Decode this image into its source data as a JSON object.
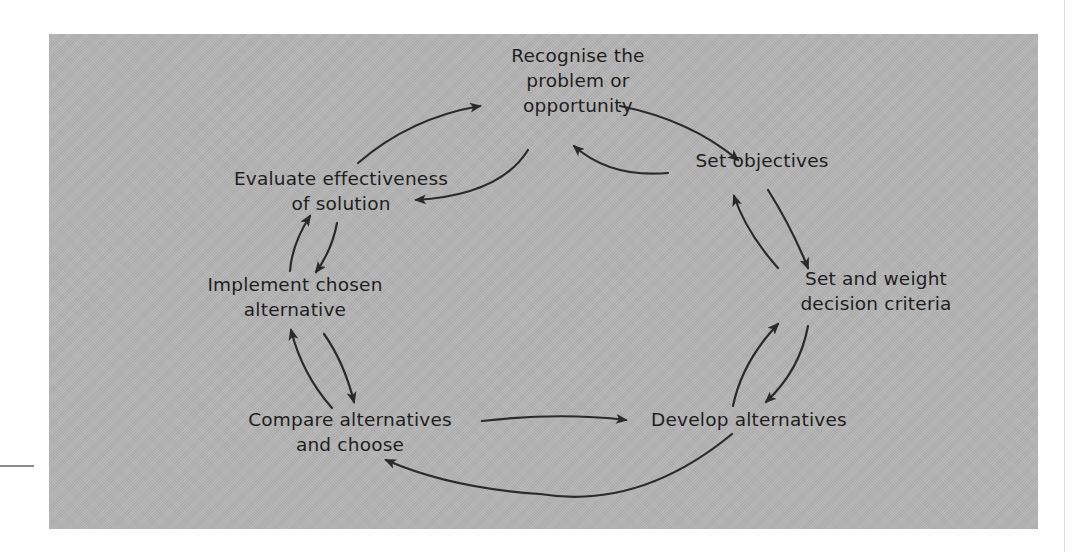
{
  "diagram": {
    "colors": {
      "panel_background": "#b4b4b4",
      "text": "#1e1e1e",
      "arrow": "#2a2a2a",
      "page_background": "#ffffff"
    },
    "nodes": [
      {
        "id": "recognise",
        "lines": [
          "Recognise the",
          "problem or",
          "opportunity"
        ]
      },
      {
        "id": "objectives",
        "lines": [
          "Set objectives"
        ]
      },
      {
        "id": "criteria",
        "lines": [
          "Set and weight",
          "decision criteria"
        ]
      },
      {
        "id": "develop",
        "lines": [
          "Develop alternatives"
        ]
      },
      {
        "id": "compare",
        "lines": [
          "Compare alternatives",
          "and choose"
        ]
      },
      {
        "id": "implement",
        "lines": [
          "Implement chosen",
          "alternative"
        ]
      },
      {
        "id": "evaluate",
        "lines": [
          "Evaluate effectiveness",
          "of solution"
        ]
      }
    ],
    "edges": [
      {
        "from": "recognise",
        "to": "objectives"
      },
      {
        "from": "objectives",
        "to": "recognise"
      },
      {
        "from": "objectives",
        "to": "criteria"
      },
      {
        "from": "criteria",
        "to": "objectives"
      },
      {
        "from": "criteria",
        "to": "develop"
      },
      {
        "from": "develop",
        "to": "criteria"
      },
      {
        "from": "compare",
        "to": "develop"
      },
      {
        "from": "develop",
        "to": "compare"
      },
      {
        "from": "compare",
        "to": "implement"
      },
      {
        "from": "implement",
        "to": "compare"
      },
      {
        "from": "implement",
        "to": "evaluate"
      },
      {
        "from": "evaluate",
        "to": "implement"
      },
      {
        "from": "evaluate",
        "to": "recognise"
      },
      {
        "from": "recognise",
        "to": "evaluate"
      }
    ]
  }
}
